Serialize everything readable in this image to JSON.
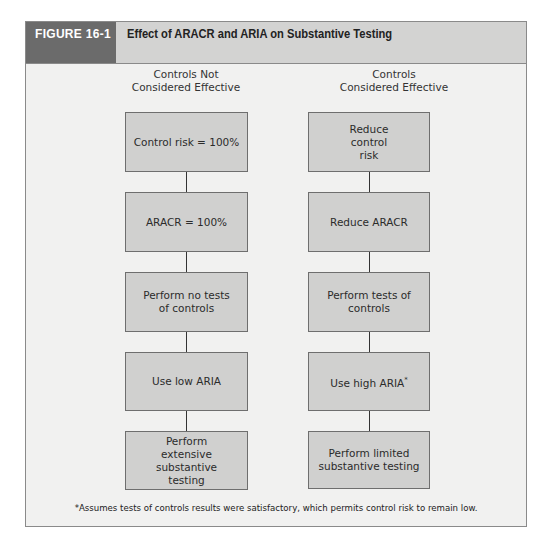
{
  "figure": {
    "label": "FIGURE 16-1",
    "title": "Effect of ARACR and ARIA on Substantive Testing",
    "colors": {
      "label_bg": "#6b6b6b",
      "header_bg": "#d3d3d2",
      "panel_bg": "#f1f1f0",
      "box_bg": "#d0d0cf",
      "border": "#6e6e6e"
    }
  },
  "columns": [
    {
      "heading_line1": "Controls Not",
      "heading_line2": "Considered Effective",
      "boxes": [
        {
          "text": "Control risk = 100%"
        },
        {
          "text": "ARACR = 100%"
        },
        {
          "text": "Perform no tests of controls"
        },
        {
          "text": "Use low ARIA"
        },
        {
          "text": "Perform extensive substantive testing"
        }
      ]
    },
    {
      "heading_line1": "Controls",
      "heading_line2": "Considered Effective",
      "boxes": [
        {
          "text": "Reduce control risk"
        },
        {
          "text": "Reduce ARACR"
        },
        {
          "text": "Perform tests of controls"
        },
        {
          "text": "Use high ARIA",
          "marker": "*"
        },
        {
          "text": "Perform limited substantive testing"
        }
      ]
    }
  ],
  "footnote": "*Assumes tests of controls results were satisfactory, which permits control risk to remain low."
}
